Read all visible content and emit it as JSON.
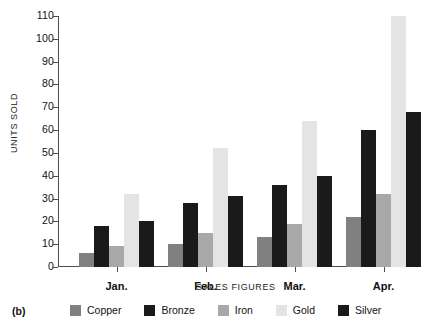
{
  "caption": "(b)",
  "chart_data": {
    "type": "bar",
    "title": "",
    "xlabel": "SALES FIGURES",
    "ylabel": "UNITS SOLD",
    "categories": [
      "Jan.",
      "Feb.",
      "Mar.",
      "Apr."
    ],
    "series": [
      {
        "name": "Copper",
        "color": "#808080",
        "values": [
          6,
          10,
          13,
          22
        ]
      },
      {
        "name": "Bronze",
        "color": "#1a1a1a",
        "values": [
          18,
          28,
          36,
          60
        ]
      },
      {
        "name": "Iron",
        "color": "#a8a8a8",
        "values": [
          9,
          15,
          19,
          32
        ]
      },
      {
        "name": "Gold",
        "color": "#e4e4e4",
        "values": [
          32,
          52,
          64,
          110
        ]
      },
      {
        "name": "Silver",
        "color": "#1a1a1a",
        "values": [
          20,
          31,
          40,
          68
        ]
      }
    ],
    "ylim": [
      0,
      110
    ],
    "ytick_labels": [
      "0",
      "10",
      "20",
      "30",
      "40",
      "50",
      "60",
      "70",
      "80",
      "90",
      "100",
      "110"
    ],
    "ytick_values": [
      0,
      10,
      20,
      30,
      40,
      50,
      60,
      70,
      80,
      90,
      100,
      110
    ],
    "grid": false,
    "legend_position": "bottom"
  }
}
